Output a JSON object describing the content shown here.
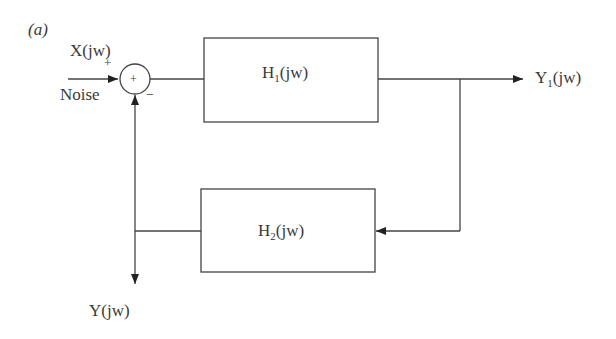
{
  "figure": {
    "panel_label": "(a)",
    "input_label": "X(jw)",
    "noise_label": "Noise",
    "plus_sign": "+",
    "minus_sign": "−",
    "summing_symbol": "+",
    "blocks": [
      {
        "name": "H",
        "subscript": "1",
        "suffix": "(jw)"
      },
      {
        "name": "H",
        "subscript": "2",
        "suffix": "(jw)"
      }
    ],
    "output1": {
      "name": "Y",
      "subscript": "1",
      "suffix": "(jw)"
    },
    "output2_label": "Y(jw)"
  }
}
